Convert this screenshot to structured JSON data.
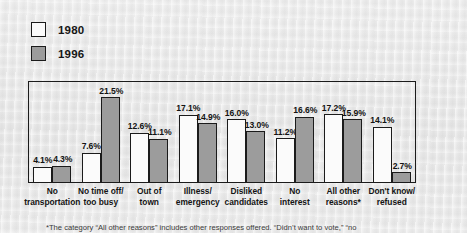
{
  "legend": {
    "items": [
      {
        "label": "1980",
        "color": "#fbfbfb",
        "swatch_name": "legend-swatch-1980"
      },
      {
        "label": "1996",
        "color": "#9c9c9c",
        "swatch_name": "legend-swatch-1996"
      }
    ]
  },
  "footnote": {
    "text": "*The category “All other reasons” includes other responses offered. “Didn’t want to vote,” “no"
  },
  "chart_data": {
    "type": "bar",
    "title": "",
    "subtitle": "",
    "xlabel": "",
    "ylabel": "",
    "ylim": [
      0,
      21.5
    ],
    "grid": false,
    "legend_position": "top-left",
    "value_label_suffix": "%",
    "categories": [
      "No\ntransportation",
      "No time off/\ntoo busy",
      "Out of\ntown",
      "Illness/\nemergency",
      "Disliked\ncandidates",
      "No\ninterest",
      "All other\nreasons*",
      "Don't know/\nrefused"
    ],
    "categories_lines": [
      [
        "No",
        "transportation"
      ],
      [
        "No time off/",
        "too busy"
      ],
      [
        "Out of",
        "town"
      ],
      [
        "Illness/",
        "emergency"
      ],
      [
        "Disliked",
        "candidates"
      ],
      [
        "No",
        "interest"
      ],
      [
        "All other",
        "reasons*"
      ],
      [
        "Don't know/",
        "refused"
      ]
    ],
    "series": [
      {
        "name": "1980",
        "color": "#fbfbfb",
        "values": [
          4.1,
          7.6,
          12.6,
          17.1,
          16.0,
          11.2,
          17.2,
          14.1
        ],
        "labels": [
          "4.1%",
          "7.6%",
          "12.6%",
          "17.1%",
          "16.0%",
          "11.2%",
          "17.2%",
          "14.1%"
        ]
      },
      {
        "name": "1996",
        "color": "#9c9c9c",
        "values": [
          4.3,
          21.5,
          11.1,
          14.9,
          13.0,
          16.6,
          15.9,
          2.7
        ],
        "labels": [
          "4.3%",
          "21.5%",
          "11.1%",
          "14.9%",
          "13.0%",
          "16.6%",
          "15.9%",
          "2.7%"
        ]
      }
    ]
  }
}
